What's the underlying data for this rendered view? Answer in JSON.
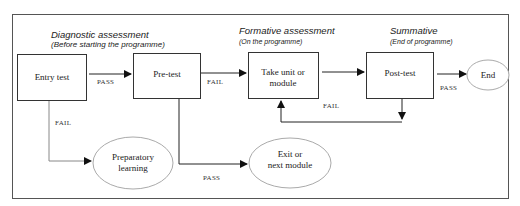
{
  "diagram": {
    "type": "flowchart",
    "phases": [
      {
        "title": "Diagnostic assessment",
        "subtitle": "(Before starting the programme)"
      },
      {
        "title": "Formative assessment",
        "subtitle": "(On the programme)"
      },
      {
        "title": "Summative",
        "subtitle": "(End of programme)"
      }
    ],
    "nodes": {
      "entry_test": {
        "line1": "Entry test"
      },
      "pre_test": {
        "line1": "Pre-test"
      },
      "take_unit": {
        "line1": "Take unit or",
        "line2": "module"
      },
      "post_test": {
        "line1": "Post-test"
      },
      "end": {
        "line1": "End"
      },
      "preparatory": {
        "line1": "Preparatory",
        "line2": "learning"
      },
      "exit": {
        "line1": "Exit or",
        "line2": "next module"
      }
    },
    "edges": {
      "entry_to_pre": "PASS",
      "entry_to_prep": "FAIL",
      "pre_to_take": "FAIL",
      "pre_to_exit": "PASS",
      "post_to_end": "PASS",
      "post_to_take": "FAIL"
    },
    "colors": {
      "stroke": "#333333",
      "ellipse_stroke": "#999999",
      "background": "#ffffff"
    }
  }
}
